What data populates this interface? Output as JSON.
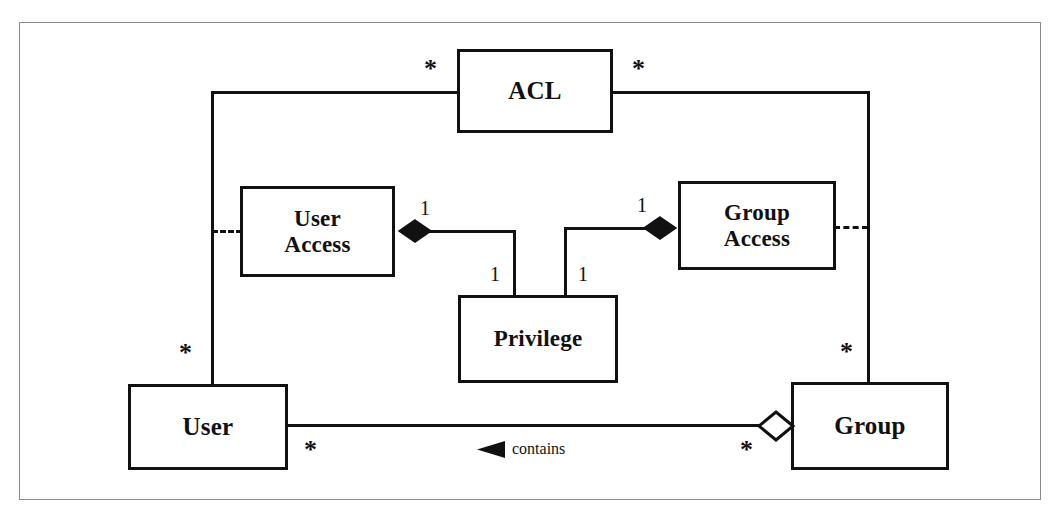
{
  "diagram": {
    "type": "uml-class-diagram",
    "colors": {
      "line": "#111111",
      "box_fill": "#ffffff",
      "frame": "#8a8a8a",
      "background": "#ffffff"
    },
    "classes": [
      {
        "id": "acl",
        "label": "ACL",
        "x": 457,
        "y": 49,
        "w": 156,
        "h": 84
      },
      {
        "id": "useraccess",
        "label": "User\nAccess",
        "x": 240,
        "y": 186,
        "w": 155,
        "h": 91
      },
      {
        "id": "groupaccess",
        "label": "Group\nAccess",
        "x": 678,
        "y": 181,
        "w": 158,
        "h": 89
      },
      {
        "id": "privilege",
        "label": "Privilege",
        "x": 458,
        "y": 295,
        "w": 160,
        "h": 88
      },
      {
        "id": "user",
        "label": "User",
        "x": 128,
        "y": 384,
        "w": 160,
        "h": 86
      },
      {
        "id": "group",
        "label": "Group",
        "x": 791,
        "y": 382,
        "w": 158,
        "h": 88
      }
    ],
    "multiplicities": {
      "acl_left": "*",
      "acl_right": "*",
      "user_top": "*",
      "group_top": "*",
      "user_right": "*",
      "group_left": "*",
      "useraccess_right": "1",
      "groupaccess_left": "1",
      "privilege_left": "1",
      "privilege_right": "1"
    },
    "roles": {
      "contains": "contains"
    },
    "associations": [
      {
        "id": "acl-user",
        "from": "acl",
        "to": "user",
        "from_mult": "*",
        "to_mult": "*",
        "style": "solid"
      },
      {
        "id": "acl-group",
        "from": "acl",
        "to": "group",
        "from_mult": "*",
        "to_mult": "*",
        "style": "solid"
      },
      {
        "id": "useraccess-rail",
        "from": "useraccess",
        "to": "acl-user-rail",
        "style": "dashed"
      },
      {
        "id": "groupaccess-rail",
        "from": "groupaccess",
        "to": "acl-group-rail",
        "style": "dashed"
      },
      {
        "id": "useraccess-privilege",
        "from": "useraccess",
        "to": "privilege",
        "from_mult": "1",
        "to_mult": "1",
        "style": "solid",
        "decoration": "filled-diamond"
      },
      {
        "id": "groupaccess-privilege",
        "from": "groupaccess",
        "to": "privilege",
        "from_mult": "1",
        "to_mult": "1",
        "style": "solid",
        "decoration": "filled-diamond"
      },
      {
        "id": "user-group-contains",
        "from": "user",
        "to": "group",
        "from_mult": "*",
        "to_mult": "*",
        "style": "solid",
        "decoration": "hollow-diamond",
        "role": "contains",
        "direction": "left"
      }
    ]
  }
}
